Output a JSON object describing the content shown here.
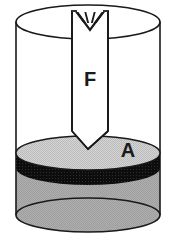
{
  "figure": {
    "name": "hydraulic-piston-cylinder-diagram",
    "type": "technical-illustration",
    "background_color": "#ffffff",
    "labels": {
      "force_label": "F",
      "area_label": "A"
    },
    "colors": {
      "outline": "#1a1a1a",
      "fluid_gray": "#a8a8a8",
      "piston_top_gray": "#c9c9c9",
      "piston_band_black": "#111111",
      "rod_white": "#ffffff",
      "label_text": "#1a1a1a"
    },
    "geometry": {
      "cylinder_left_x": 16,
      "cylinder_right_x": 160,
      "cylinder_top_ellipse_cy": 22,
      "cylinder_bottom_ellipse_cy": 215,
      "ellipse_rx": 72,
      "ellipse_ry": 17,
      "rod_left_x": 72,
      "rod_right_x": 108,
      "rod_tip_y": 149,
      "rod_shoulder_y": 131,
      "rod_notch_tip_y": 28,
      "piston_top_cy": 153,
      "piston_band_height": 15
    },
    "parts": {
      "cylinder": "outer cylinder wall, transparent outline",
      "piston_rod": "vertical rod with V-notch at top and V-point at bottom",
      "piston_disk": "gray elliptical plate with black rim band",
      "fluid": "gray shaded fluid filling lower cylinder",
      "force_arrow_label": "F denotes applied force on the rod",
      "area_label": "A denotes piston surface area"
    }
  }
}
